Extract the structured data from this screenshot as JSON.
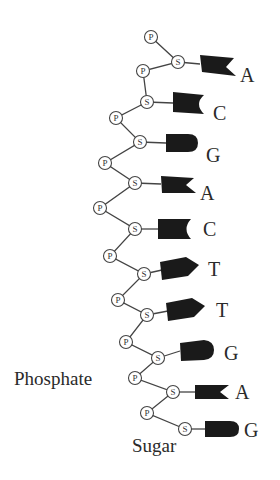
{
  "diagram": {
    "labels": {
      "phosphate": "Phosphate",
      "sugar": "Sugar"
    },
    "node_letters": {
      "phosphate": "P",
      "sugar": "S"
    },
    "colors": {
      "line": "#444444",
      "base_fill": "#1a1a1a",
      "text": "#2a2a2a",
      "background": "#ffffff"
    },
    "sequence": [
      "A",
      "C",
      "G",
      "A",
      "C",
      "T",
      "T",
      "G",
      "A",
      "G"
    ],
    "bases": [
      {
        "letter": "A",
        "shape": "adenine-notch"
      },
      {
        "letter": "C",
        "shape": "cytosine-concave"
      },
      {
        "letter": "G",
        "shape": "guanine-rounded"
      },
      {
        "letter": "A",
        "shape": "adenine-notch"
      },
      {
        "letter": "C",
        "shape": "cytosine-concave"
      },
      {
        "letter": "T",
        "shape": "thymine-point"
      },
      {
        "letter": "T",
        "shape": "thymine-point"
      },
      {
        "letter": "G",
        "shape": "guanine-rounded"
      },
      {
        "letter": "A",
        "shape": "adenine-notch"
      },
      {
        "letter": "G",
        "shape": "guanine-rounded"
      }
    ]
  }
}
